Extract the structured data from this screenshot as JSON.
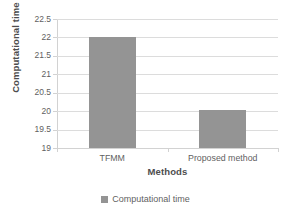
{
  "chart_data": {
    "type": "bar",
    "title": "",
    "categories": [
      "TFMM",
      "Proposed method"
    ],
    "values": [
      22.0,
      20.03
    ],
    "series": [
      {
        "name": "Computational time",
        "values": [
          22.0,
          20.03
        ],
        "color": "#949494"
      }
    ],
    "xlabel": "Methods",
    "ylabel": "Computational time (ms)",
    "ylim": [
      19,
      22.5
    ],
    "ytick_step": 0.5,
    "yticks": [
      22.5,
      22,
      21.5,
      21,
      20.5,
      20,
      19.5,
      19
    ],
    "ytick_labels": [
      "22.5",
      "22",
      "21.5",
      "21",
      "20.5",
      "20",
      "19.5",
      "19"
    ],
    "grid": "horizontal",
    "legend_position": "bottom",
    "legend_entries": [
      "Computational time"
    ],
    "colors": {
      "bar": "#949494",
      "gridline": "#dcdcdc",
      "axis": "#d2d2d2",
      "text": "#5f5f5f",
      "title_text": "#4d4d4d",
      "background": "#ffffff"
    }
  },
  "axes": {
    "y_title": "Computational time (ms)",
    "x_title": "Methods"
  },
  "legend": {
    "items": [
      {
        "label": "Computational time",
        "marker": "square-swatch"
      }
    ]
  }
}
